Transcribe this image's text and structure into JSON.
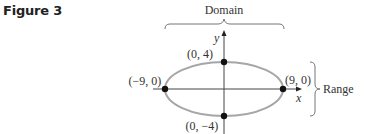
{
  "figure": {
    "label": "Figure 3"
  },
  "diagram": {
    "type": "ellipse-domain-range",
    "domain_label": "Domain",
    "range_label": "Range",
    "axes": {
      "x_label": "x",
      "y_label": "y"
    },
    "points": [
      {
        "id": "top",
        "label": "(0, 4)",
        "x": 0,
        "y": 4
      },
      {
        "id": "bottom",
        "label": "(0, −4)",
        "x": 0,
        "y": -4
      },
      {
        "id": "left",
        "label": "(−9, 0)",
        "x": -9,
        "y": 0
      },
      {
        "id": "right",
        "label": "(9, 0)",
        "x": 9,
        "y": 0
      }
    ],
    "colors": {
      "ellipse": "#a6a6a6",
      "axes": "#444444",
      "points": "#111111",
      "braces": "#777777",
      "text": "#333333"
    }
  }
}
